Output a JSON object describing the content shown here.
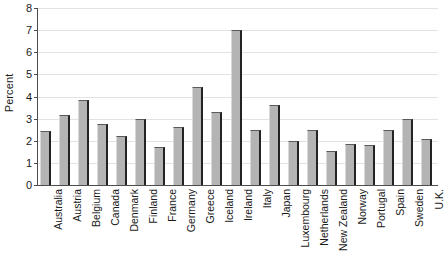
{
  "chart_data": {
    "type": "bar",
    "title": "",
    "xlabel": "",
    "ylabel": "Percent",
    "ylim": [
      0,
      8
    ],
    "yticks": [
      0,
      1,
      2,
      3,
      4,
      5,
      6,
      7,
      8
    ],
    "grid": true,
    "legend": false,
    "bar_color": "#b4b4b4",
    "bar_edge_color": "#232323",
    "gridline_color": "#e2e2e2",
    "axis_color": "#4d4d4d",
    "categories": [
      "Australia",
      "Austria",
      "Belgium",
      "Canada",
      "Denmark",
      "Finland",
      "France",
      "Germany",
      "Greece",
      "Iceland",
      "Ireland",
      "Italy",
      "Japan",
      "Luxembourg",
      "Netherlands",
      "New Zealand",
      "Norway",
      "Portugal",
      "Spain",
      "Sweden",
      "U.K."
    ],
    "values": [
      2.45,
      3.15,
      3.85,
      2.75,
      2.2,
      3.0,
      1.7,
      2.6,
      4.45,
      3.3,
      7.0,
      2.5,
      3.6,
      2.0,
      2.5,
      1.55,
      1.85,
      1.8,
      2.5,
      3.0,
      2.1
    ]
  }
}
